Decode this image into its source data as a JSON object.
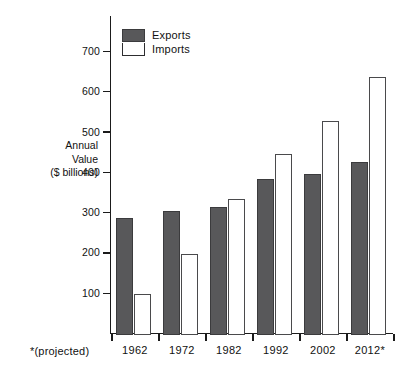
{
  "chart_data": {
    "type": "bar",
    "title": "",
    "xlabel": "",
    "ylabel": "Annual Value ($ billions)",
    "ylabel_lines": [
      "Annual",
      "Value",
      "($ billions)"
    ],
    "categories": [
      "1962",
      "1972",
      "1982",
      "1992",
      "2002",
      "2012*"
    ],
    "series": [
      {
        "name": "Exports",
        "values": [
          290,
          307,
          317,
          385,
          398,
          428
        ],
        "color": "#58585a"
      },
      {
        "name": "Imports",
        "values": [
          100,
          200,
          337,
          447,
          530,
          640
        ],
        "color": "#ffffff"
      }
    ],
    "ylim": [
      0,
      740
    ],
    "yticks": [
      100,
      200,
      300,
      400,
      500,
      600,
      700
    ],
    "ytick_labels": [
      "100",
      "200",
      "300",
      "400",
      "500",
      "600",
      "700"
    ],
    "grid": false,
    "legend": {
      "position": "top-left",
      "entries": [
        "Exports",
        "Imports"
      ]
    },
    "annotations": [
      "*(projected)"
    ]
  },
  "legend": {
    "entries": [
      {
        "label": "Exports",
        "swatch": "filled-dark-gray-square"
      },
      {
        "label": "Imports",
        "swatch": "outlined-white-square"
      }
    ]
  },
  "axes": {
    "y_title_lines": [
      "Annual",
      "Value",
      "($ billions)"
    ],
    "y_tick_labels": [
      "700",
      "600",
      "500",
      "400",
      "300",
      "200",
      "100"
    ],
    "x_tick_labels": [
      "1962",
      "1972",
      "1982",
      "1992",
      "2002",
      "2012*"
    ]
  },
  "footnote": {
    "text": "*(projected)"
  }
}
